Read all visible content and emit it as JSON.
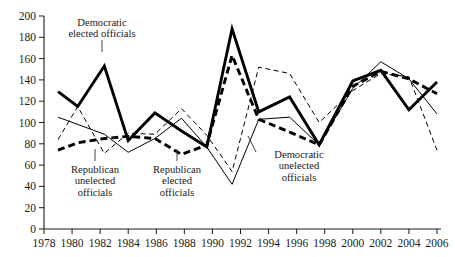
{
  "chart_data": {
    "type": "line",
    "title": "",
    "xlabel": "",
    "ylabel": "",
    "xlim": [
      1978,
      2006
    ],
    "ylim": [
      0,
      200
    ],
    "grid": false,
    "legend_position": "inline-annotations",
    "x_ticks": [
      1978,
      1980,
      1982,
      1984,
      1986,
      1988,
      1990,
      1992,
      1994,
      1996,
      1998,
      2000,
      2002,
      2004,
      2006
    ],
    "y_ticks": [
      0,
      20,
      40,
      60,
      80,
      100,
      120,
      140,
      160,
      180,
      200
    ],
    "series": [
      {
        "name": "Democratic elected officials",
        "style": "thick-solid",
        "color": "#000000",
        "points": [
          [
            1979.0,
            129
          ],
          [
            1980.4,
            115
          ],
          [
            1982.3,
            153
          ],
          [
            1984.0,
            83
          ],
          [
            1985.9,
            109
          ],
          [
            1987.8,
            92
          ],
          [
            1989.6,
            77
          ],
          [
            1991.4,
            188
          ],
          [
            1993.3,
            110
          ],
          [
            1995.5,
            124
          ],
          [
            1997.6,
            79
          ],
          [
            2000.0,
            139
          ],
          [
            2002.0,
            149
          ],
          [
            2004.0,
            112
          ],
          [
            2006.0,
            138
          ]
        ]
      },
      {
        "name": "Democratic unelected officials",
        "style": "thin-solid",
        "color": "#000000",
        "points": [
          [
            1979.0,
            105
          ],
          [
            1982.3,
            89
          ],
          [
            1984.0,
            72
          ],
          [
            1985.9,
            85
          ],
          [
            1987.8,
            104
          ],
          [
            1989.6,
            77
          ],
          [
            1991.4,
            42
          ],
          [
            1993.3,
            103
          ],
          [
            1995.5,
            105
          ],
          [
            1997.6,
            79
          ],
          [
            2000.0,
            132
          ],
          [
            2002.0,
            157
          ],
          [
            2004.0,
            141
          ],
          [
            2006.0,
            108
          ]
        ]
      },
      {
        "name": "Republican elected officials",
        "style": "thick-dashed",
        "color": "#000000",
        "points": [
          [
            1979.0,
            74
          ],
          [
            1980.4,
            81
          ],
          [
            1982.3,
            85
          ],
          [
            1984.0,
            87
          ],
          [
            1985.9,
            85
          ],
          [
            1987.8,
            70
          ],
          [
            1989.6,
            79
          ],
          [
            1991.4,
            163
          ],
          [
            1993.3,
            103
          ],
          [
            1995.5,
            91
          ],
          [
            1997.6,
            79
          ],
          [
            2000.0,
            134
          ],
          [
            2002.0,
            148
          ],
          [
            2004.0,
            141
          ],
          [
            2006.0,
            127
          ]
        ]
      },
      {
        "name": "Republican unelected officials",
        "style": "thin-dashed",
        "color": "#000000",
        "points": [
          [
            1979.0,
            84
          ],
          [
            1980.4,
            115
          ],
          [
            1982.3,
            71
          ],
          [
            1984.0,
            90
          ],
          [
            1985.9,
            89
          ],
          [
            1987.8,
            113
          ],
          [
            1989.6,
            88
          ],
          [
            1991.4,
            54
          ],
          [
            1993.3,
            152
          ],
          [
            1995.5,
            146
          ],
          [
            1997.6,
            100
          ],
          [
            2000.0,
            130
          ],
          [
            2002.0,
            146
          ],
          [
            2004.0,
            143
          ],
          [
            2006.0,
            74
          ]
        ]
      }
    ]
  },
  "annotations": [
    {
      "id": "dem-elected",
      "line1": "Democratic",
      "line2": "elected officials",
      "target_series": "Democratic elected officials"
    },
    {
      "id": "rep-unelected",
      "line1": "Republican",
      "line2": "unelected",
      "line3": "officials",
      "target_series": "Republican unelected officials"
    },
    {
      "id": "rep-elected",
      "line1": "Republican",
      "line2": "elected",
      "line3": "officials",
      "target_series": "Republican elected officials"
    },
    {
      "id": "dem-unelected",
      "line1": "Democratic",
      "line2": "unelected",
      "line3": "officials",
      "target_series": "Democratic unelected officials"
    }
  ],
  "axis": {
    "y_labels": [
      "200",
      "180",
      "160",
      "140",
      "120",
      "100",
      "80",
      "60",
      "40",
      "20",
      "0"
    ],
    "x_labels": [
      "1978",
      "1980",
      "1982",
      "1984",
      "1986",
      "1988",
      "1990",
      "1992",
      "1994",
      "1996",
      "1998",
      "2000",
      "2002",
      "2004",
      "2006"
    ]
  }
}
